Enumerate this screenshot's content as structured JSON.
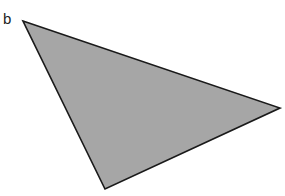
{
  "label": "b",
  "triangle": {
    "vertices": [
      [
        23,
        21
      ],
      [
        280,
        108
      ],
      [
        105,
        189
      ]
    ],
    "fill": "#a6a6a6",
    "stroke": "#1a1a1a"
  }
}
